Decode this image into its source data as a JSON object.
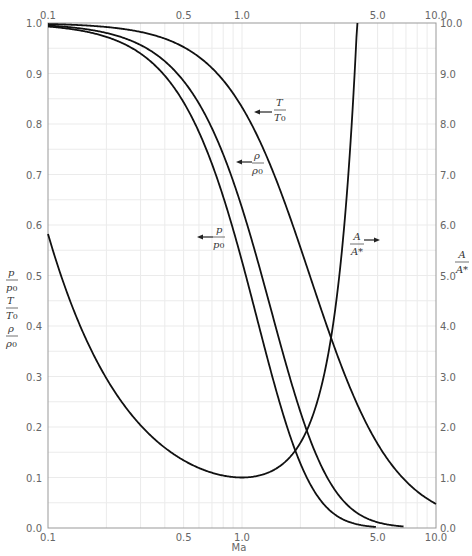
{
  "chart_data": {
    "type": "line",
    "title": "",
    "xlabel": "Ma",
    "xscale": "log",
    "xlim": [
      0.1,
      10.0
    ],
    "x_ticks": [
      "0.1",
      "0.5",
      "1.0",
      "5.0",
      "10.0"
    ],
    "x_ticks_top": [
      "0.1",
      "0.5",
      "1.0",
      "5.0",
      "10.0"
    ],
    "ylabel_left": [
      "p/p0",
      "T/T0",
      "ρ/ρ0"
    ],
    "ylim_left": [
      0.0,
      1.0
    ],
    "y_ticks_left": [
      "0.0",
      "0.1",
      "0.2",
      "0.3",
      "0.4",
      "0.5",
      "0.6",
      "0.7",
      "0.8",
      "0.9",
      "1.0"
    ],
    "ylabel_right": "A/A*",
    "ylim_right": [
      0.0,
      10.0
    ],
    "y_ticks_right": [
      "0.0",
      "1.0",
      "2.0",
      "3.0",
      "4.0",
      "5.0",
      "6.0",
      "7.0",
      "8.0",
      "9.0",
      "10.0"
    ],
    "grid": true,
    "gamma": 1.4,
    "series": [
      {
        "name": "T/T0",
        "axis": "left",
        "x": [
          0.1,
          0.2,
          0.5,
          1.0,
          1.5,
          2.0,
          3.0,
          5.0,
          10.0
        ],
        "values": [
          0.998,
          0.992,
          0.952,
          0.833,
          0.69,
          0.556,
          0.357,
          0.167,
          0.048
        ]
      },
      {
        "name": "ρ/ρ0",
        "axis": "left",
        "x": [
          0.1,
          0.2,
          0.5,
          1.0,
          1.5,
          2.0,
          3.0,
          5.0,
          7.0
        ],
        "values": [
          0.995,
          0.98,
          0.885,
          0.634,
          0.395,
          0.23,
          0.076,
          0.011,
          0.002
        ]
      },
      {
        "name": "p/p0",
        "axis": "left",
        "x": [
          0.1,
          0.2,
          0.5,
          1.0,
          1.5,
          2.0,
          3.0,
          5.0
        ],
        "values": [
          0.993,
          0.973,
          0.843,
          0.528,
          0.272,
          0.128,
          0.027,
          0.002
        ]
      },
      {
        "name": "A/A*",
        "axis": "right",
        "x": [
          0.1,
          0.2,
          0.5,
          1.0,
          1.5,
          2.0,
          3.0,
          4.0
        ],
        "values": [
          5.82,
          2.96,
          1.34,
          1.0,
          1.18,
          1.69,
          4.23,
          10.7
        ]
      }
    ],
    "annotations": [
      {
        "text": "← T/T0",
        "position": "right of T/T0 curve near Ma≈1.2"
      },
      {
        "text": "← ρ/ρ0",
        "position": "right of ρ/ρ0 curve near Ma≈0.9"
      },
      {
        "text": "← p/p0",
        "position": "left region near Ma≈0.7"
      },
      {
        "text": "A/A* →",
        "position": "right of A/A* curve near Ma≈3"
      }
    ]
  },
  "labels": {
    "xlabel": "Ma",
    "T_arrow": "T",
    "T_sub": "T",
    "T_sub0": "0",
    "rho_num": "ρ",
    "rho_den": "ρ",
    "rho_den0": "0",
    "p_num": "p",
    "p_den": "p",
    "p_den0": "0",
    "A_num": "A",
    "A_den": "A*",
    "right_A_num": "A",
    "right_A_den": "A*"
  }
}
